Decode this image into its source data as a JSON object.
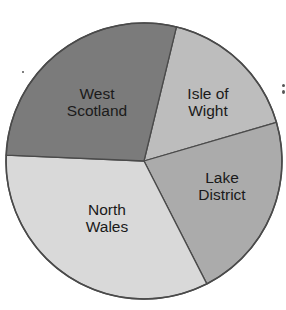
{
  "chart_data": {
    "type": "pie",
    "title": "",
    "categories": [
      "Isle of Wight",
      "Lake District",
      "North Wales",
      "West Scotland"
    ],
    "values": [
      16.7,
      22.0,
      33.2,
      28.1
    ],
    "start_angle_deg": 13.6,
    "direction": "clockwise",
    "legend": "none (labels inside slices)",
    "slices": [
      {
        "label": "Isle of Wight",
        "lines": [
          "Isle of",
          "Wight"
        ],
        "value": 16.7,
        "color": "#bdbdbd",
        "label_pos": [
          208,
          102
        ]
      },
      {
        "label": "Lake District",
        "lines": [
          "Lake",
          "District"
        ],
        "value": 22.0,
        "color": "#ababab",
        "label_pos": [
          222,
          186
        ]
      },
      {
        "label": "North Wales",
        "lines": [
          "North",
          "Wales"
        ],
        "value": 33.2,
        "color": "#d9d9d9",
        "label_pos": [
          107,
          218
        ]
      },
      {
        "label": "West Scotland",
        "lines": [
          "West",
          "Scotland"
        ],
        "value": 28.1,
        "color": "#7b7b7b",
        "label_pos": [
          97,
          102
        ]
      }
    ]
  },
  "style": {
    "stroke": "#4a4a4a",
    "center": [
      144,
      161
    ],
    "radius": 138
  }
}
